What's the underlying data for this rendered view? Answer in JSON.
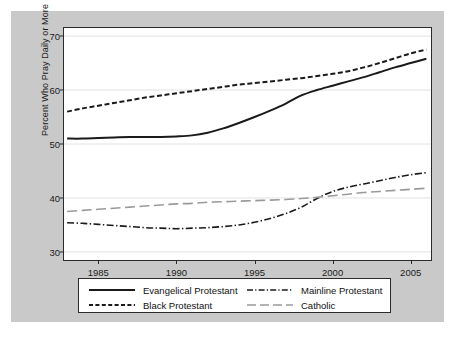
{
  "chart_data": {
    "type": "line",
    "title": "",
    "xlabel": "",
    "ylabel": "Percent Who Pray Daily or More",
    "xlim": [
      1982.8,
      2006.3
    ],
    "ylim": [
      28.5,
      71.5
    ],
    "xticks": [
      1985,
      1990,
      1995,
      2000,
      2005
    ],
    "yticks": [
      30,
      40,
      50,
      60,
      70
    ],
    "xtick_labels": [
      "1985",
      "1990",
      "1995",
      "2000",
      "2005"
    ],
    "ytick_labels": [
      "30",
      "40",
      "50",
      "60",
      "70"
    ],
    "grid": "horizontal",
    "legend_position": "below-plot",
    "x": [
      1983,
      1984,
      1985,
      1986,
      1987,
      1988,
      1989,
      1990,
      1991,
      1992,
      1993,
      1994,
      1995,
      1996,
      1997,
      1998,
      1999,
      2000,
      2001,
      2002,
      2003,
      2004,
      2005,
      2006
    ],
    "series": [
      {
        "name": "Evangelical Protestant",
        "style": "solid",
        "color": "#1a1a1a",
        "width": 2.0,
        "values": [
          51.0,
          51.0,
          51.1,
          51.2,
          51.3,
          51.3,
          51.3,
          51.4,
          51.6,
          52.1,
          52.9,
          53.9,
          55.0,
          56.2,
          57.5,
          59.0,
          60.0,
          60.8,
          61.6,
          62.4,
          63.3,
          64.2,
          65.0,
          65.8
        ]
      },
      {
        "name": "Black Protestant",
        "style": "dashed",
        "color": "#1a1a1a",
        "width": 2.0,
        "values": [
          56.0,
          56.6,
          57.1,
          57.6,
          58.1,
          58.6,
          59.0,
          59.4,
          59.8,
          60.2,
          60.6,
          61.0,
          61.3,
          61.6,
          61.9,
          62.2,
          62.6,
          63.0,
          63.5,
          64.2,
          65.0,
          65.9,
          66.8,
          67.5
        ]
      },
      {
        "name": "Mainline Protestant",
        "style": "dash-dot",
        "color": "#1a1a1a",
        "width": 1.6,
        "values": [
          35.4,
          35.3,
          35.1,
          34.9,
          34.7,
          34.5,
          34.4,
          34.3,
          34.4,
          34.5,
          34.7,
          35.0,
          35.5,
          36.2,
          37.1,
          38.3,
          39.9,
          41.2,
          42.0,
          42.6,
          43.2,
          43.8,
          44.3,
          44.7
        ]
      },
      {
        "name": "Catholic",
        "style": "long-dash",
        "color": "#9a9a9a",
        "width": 1.6,
        "values": [
          37.5,
          37.7,
          37.9,
          38.1,
          38.3,
          38.5,
          38.7,
          38.9,
          39.0,
          39.2,
          39.3,
          39.4,
          39.5,
          39.6,
          39.7,
          39.9,
          40.1,
          40.4,
          40.7,
          41.0,
          41.2,
          41.4,
          41.6,
          41.8
        ]
      }
    ]
  },
  "legend": {
    "entries": [
      {
        "label": "Evangelical Protestant"
      },
      {
        "label": "Black Protestant"
      },
      {
        "label": "Mainline Protestant"
      },
      {
        "label": "Catholic"
      }
    ]
  },
  "axes": {
    "y_label": "Percent Who Pray Daily or More"
  },
  "colors": {
    "figure_background": "#c9c9c9",
    "plot_background": "#ffffff",
    "axis": "#2b2b2b",
    "grid": "#e2e2e2",
    "ink": "#1a1a1a",
    "muted_line": "#9a9a9a"
  }
}
